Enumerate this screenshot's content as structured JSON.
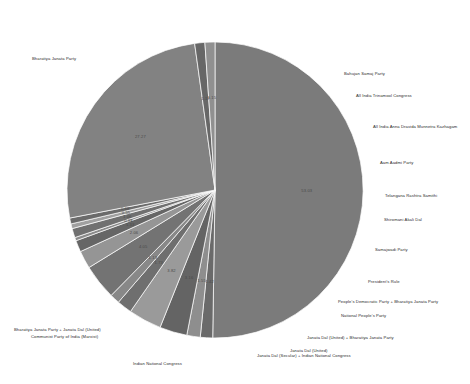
{
  "chart_data": {
    "type": "pie",
    "title": "",
    "subtitle": "",
    "legend_position": "outside-labels",
    "grid": false,
    "value_format": "percent",
    "categories": [
      "Bharatiya Janata Party",
      "Bahujan Samaj Party",
      "All India Trinamool Congress",
      "All India Anna Dravida Munnetra Kazhagam",
      "Aam Aadmi Party",
      "Telangana Rashtra Samithi",
      "Shiromani Akali Dal",
      "Samajwadi Party",
      "President's Rule",
      "People's Democratic Party + Bharatiya Janata Party",
      "National People's Party",
      "Janata Dal (United) + Bharatiya Janata Party",
      "Janata Dal (United)",
      "Janata Dal (Secular) + Indian National Congress",
      "Indian National Congress",
      "Bharatiya Janata Party + Janata Dal (United)",
      "Communist Party of India (Marxist)"
    ],
    "values": [
      53.03,
      1.42,
      1.55,
      3.16,
      3.82,
      1.73,
      1.13,
      4.05,
      2.06,
      1.33,
      0.38,
      1.06,
      0.55,
      0.68,
      27.27,
      1.17,
      1.15
    ],
    "slices": [
      {
        "label": "Bharatiya Janata Party",
        "value": 53.03,
        "pct_text": "53.03",
        "color": "#7b7b7b"
      },
      {
        "label": "Bahujan Samaj Party",
        "value": 1.42,
        "pct_text": "1.42",
        "color": "#6a6a6a"
      },
      {
        "label": "All India Trinamool Congress",
        "value": 1.55,
        "pct_text": "1.55",
        "color": "#8e8e8e"
      },
      {
        "label": "All India Anna Dravida Munnetra Kazhagam",
        "value": 3.16,
        "pct_text": "3.16",
        "color": "#646464"
      },
      {
        "label": "Aam Aadmi Party",
        "value": 3.82,
        "pct_text": "3.82",
        "color": "#9a9a9a"
      },
      {
        "label": "Telangana Rashtra Samithi",
        "value": 1.73,
        "pct_text": "1.73",
        "color": "#6f6f6f"
      },
      {
        "label": "Shiromani Akali Dal",
        "value": 1.13,
        "pct_text": "1.13",
        "color": "#888888"
      },
      {
        "label": "Samajwadi Party",
        "value": 4.05,
        "pct_text": "4.05",
        "color": "#737373"
      },
      {
        "label": "President's Rule",
        "value": 2.06,
        "pct_text": "2.06",
        "color": "#959595"
      },
      {
        "label": "People's Democratic Party + Bharatiya Janata Party",
        "value": 1.33,
        "pct_text": "1.33",
        "color": "#666666"
      },
      {
        "label": "National People's Party",
        "value": 0.38,
        "pct_text": "0.38",
        "color": "#8a8a8a"
      },
      {
        "label": "Janata Dal (United) + Bharatiya Janata Party",
        "value": 1.06,
        "pct_text": "1.06",
        "color": "#707070"
      },
      {
        "label": "Janata Dal (United)",
        "value": 0.55,
        "pct_text": "0.55",
        "color": "#a0a0a0"
      },
      {
        "label": "Janata Dal (Secular) + Indian National Congress",
        "value": 0.68,
        "pct_text": "0.68",
        "color": "#6b6b6b"
      },
      {
        "label": "Indian National Congress",
        "value": 27.27,
        "pct_text": "27.27",
        "color": "#828282"
      },
      {
        "label": "Bharatiya Janata Party + Janata Dal (United)",
        "value": 1.17,
        "pct_text": "1.17",
        "color": "#676767"
      },
      {
        "label": "Communist Party of India (Marxist)",
        "value": 1.15,
        "pct_text": "1.15",
        "color": "#909090"
      }
    ],
    "geometry": {
      "cx": 215,
      "cy": 190,
      "r": 148,
      "start_angle_deg": -90,
      "direction": "clockwise"
    },
    "outside_labels": [
      {
        "text": "Bharatiya Janata Party",
        "x": 32,
        "y": 59,
        "anchor": "start"
      },
      {
        "text": "Bahujan Samaj Party",
        "x": 344,
        "y": 74,
        "anchor": "start"
      },
      {
        "text": "All India Trinamool Congress",
        "x": 356,
        "y": 96,
        "anchor": "start"
      },
      {
        "text": "All India Anna Dravida Munnetra Kazhagam",
        "x": 373,
        "y": 127,
        "anchor": "start"
      },
      {
        "text": "Aam Aadmi Party",
        "x": 380,
        "y": 163,
        "anchor": "start"
      },
      {
        "text": "Telangana Rashtra Samithi",
        "x": 385,
        "y": 196,
        "anchor": "start"
      },
      {
        "text": "Shiromani Akali Dal",
        "x": 384,
        "y": 220,
        "anchor": "start"
      },
      {
        "text": "Samajwadi Party",
        "x": 375,
        "y": 250,
        "anchor": "start"
      },
      {
        "text": "President's Rule",
        "x": 368,
        "y": 282,
        "anchor": "start"
      },
      {
        "text": "People's Democratic Party + Bharatiya Janata Party",
        "x": 338,
        "y": 302,
        "anchor": "start"
      },
      {
        "text": "National People's Party",
        "x": 341,
        "y": 316,
        "anchor": "start"
      },
      {
        "text": "Janata Dal (United) + Bharatiya Janata Party",
        "x": 307,
        "y": 338,
        "anchor": "start"
      },
      {
        "text": "Janata Dal (United)",
        "x": 290,
        "y": 351,
        "anchor": "start"
      },
      {
        "text": "Janata Dal (Secular) + Indian National Congress",
        "x": 257,
        "y": 356,
        "anchor": "start"
      },
      {
        "text": "Indian National Congress",
        "x": 133,
        "y": 364,
        "anchor": "start"
      },
      {
        "text": "Bharatiya Janata Party + Janata Dal (United)",
        "x": 14,
        "y": 330,
        "anchor": "start"
      },
      {
        "text": "Communist Party of India (Marxist)",
        "x": 31,
        "y": 337,
        "anchor": "start"
      }
    ]
  }
}
